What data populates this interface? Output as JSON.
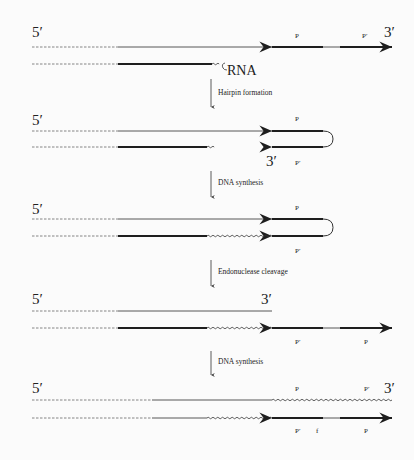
{
  "diagram": {
    "title": "",
    "colors": {
      "ink": "#1e1e1e",
      "thin": "#555555",
      "dashed": "#777777",
      "background": "#fbfbfb"
    },
    "legend_line_styles": {
      "dashed": "unreplicated / distal sequence",
      "thin": "template strand",
      "thick": "palindromic region",
      "wavy": "newly synthesized DNA"
    },
    "stages": [
      {
        "id": "stage-1",
        "labels": {
          "five_prime": "5′",
          "three_prime": "3′",
          "p": "P",
          "p_prime": "P′",
          "rna": "RNA"
        }
      },
      {
        "id": "stage-2",
        "labels": {
          "five_prime": "5′",
          "three_prime": "3′",
          "p": "P",
          "p_prime": "P′"
        }
      },
      {
        "id": "stage-3",
        "labels": {
          "five_prime": "5′",
          "p": "P",
          "p_prime": "P′"
        }
      },
      {
        "id": "stage-4",
        "labels": {
          "five_prime": "5′",
          "three_prime": "3′",
          "p": "P",
          "p_prime": "P′"
        }
      },
      {
        "id": "stage-5",
        "labels": {
          "five_prime": "5′",
          "three_prime": "3′",
          "p_top": "P",
          "p_prime_top": "P′",
          "p_prime_bottom": "P′",
          "f": "f",
          "p_bottom": "P"
        }
      }
    ],
    "steps": [
      {
        "label": "Hairpin formation"
      },
      {
        "label": "DNA synthesis"
      },
      {
        "label": "Endonuclease cleavage"
      },
      {
        "label": "DNA synthesis"
      }
    ]
  }
}
